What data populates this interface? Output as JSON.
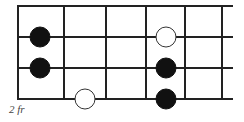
{
  "diagram": {
    "type": "fretboard-scale-diagram",
    "fret_label": "2 fr",
    "colors": {
      "line": "#222222",
      "filled": "#111111",
      "open": "#ffffff",
      "background": "#ffffff"
    },
    "strings_y": [
      6,
      37,
      68,
      99
    ],
    "frets_x": [
      18,
      64,
      106,
      146,
      185,
      222
    ],
    "string_end_x": 233,
    "dot_radius": 10,
    "notes": [
      {
        "x": 40,
        "y": 37,
        "style": "filled"
      },
      {
        "x": 40,
        "y": 68,
        "style": "filled"
      },
      {
        "x": 85,
        "y": 99,
        "style": "open"
      },
      {
        "x": 166,
        "y": 37,
        "style": "open"
      },
      {
        "x": 166,
        "y": 68,
        "style": "filled"
      },
      {
        "x": 166,
        "y": 99,
        "style": "filled"
      }
    ]
  }
}
